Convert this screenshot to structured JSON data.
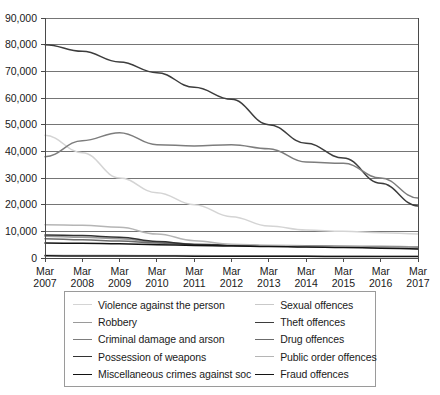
{
  "chart_data": {
    "type": "line",
    "title": "",
    "subtitle": "",
    "xlabel": "",
    "ylabel": "",
    "grid": true,
    "legend_position": "bottom",
    "ylim": [
      0,
      90000
    ],
    "yticks": [
      0,
      10000,
      20000,
      30000,
      40000,
      50000,
      60000,
      70000,
      80000,
      90000
    ],
    "ytick_labels": [
      "0",
      "10,000",
      "20,000",
      "30,000",
      "40,000",
      "50,000",
      "60,000",
      "70,000",
      "80,000",
      "90,000"
    ],
    "categories": [
      "Mar 2007",
      "Mar 2008",
      "Mar 2009",
      "Mar 2010",
      "Mar 2011",
      "Mar 2012",
      "Mar 2013",
      "Mar 2014",
      "Mar 2015",
      "Mar 2016",
      "Mar 2017"
    ],
    "xtick_labels_line1": [
      "Mar",
      "Mar",
      "Mar",
      "Mar",
      "Mar",
      "Mar",
      "Mar",
      "Mar",
      "Mar",
      "Mar",
      "Mar"
    ],
    "xtick_labels_line2": [
      "2007",
      "2008",
      "2009",
      "2010",
      "2011",
      "2012",
      "2013",
      "2014",
      "2015",
      "2016",
      "2017"
    ],
    "series": [
      {
        "name": "Violence against the person",
        "color": "#d4d4d4",
        "values": [
          46000,
          39500,
          30000,
          24500,
          20000,
          15500,
          12000,
          10500,
          10000,
          9500,
          9000
        ]
      },
      {
        "name": "Sexual offences",
        "color": "#c9c9c9",
        "values": [
          1100,
          1050,
          1000,
          950,
          900,
          850,
          800,
          800,
          750,
          700,
          650
        ]
      },
      {
        "name": "Robbery",
        "color": "#9a9a9a",
        "values": [
          8200,
          7800,
          7200,
          6000,
          5200,
          4900,
          4700,
          4600,
          4500,
          4400,
          4200
        ]
      },
      {
        "name": "Theft offences",
        "color": "#3d3d3d",
        "values": [
          80000,
          77500,
          73500,
          69500,
          64000,
          59500,
          50000,
          43000,
          37500,
          28000,
          19500
        ]
      },
      {
        "name": "Criminal damage and arson",
        "color": "#7d7d7d",
        "values": [
          38000,
          44000,
          47000,
          42500,
          42000,
          42500,
          41000,
          36000,
          35500,
          30000,
          22500
        ]
      },
      {
        "name": "Drug offences",
        "color": "#6b6b6b",
        "values": [
          7200,
          6800,
          6400,
          5600,
          5000,
          4800,
          4600,
          4400,
          4200,
          4000,
          3800
        ]
      },
      {
        "name": "Possession of weapons",
        "color": "#333333",
        "values": [
          8600,
          8400,
          7800,
          6200,
          5100,
          4800,
          4500,
          4300,
          4100,
          3900,
          3600
        ]
      },
      {
        "name": "Public order offences",
        "color": "#b5b5b5",
        "values": [
          12500,
          12300,
          11500,
          9000,
          6500,
          5200,
          4700,
          4400,
          4200,
          4000,
          3700
        ]
      },
      {
        "name": "Miscellaneous crimes against soc",
        "color": "#121212",
        "values": [
          5600,
          5500,
          5300,
          5000,
          4700,
          4500,
          4300,
          4100,
          3900,
          3700,
          3400
        ]
      },
      {
        "name": "Fraud offences",
        "color": "#141414",
        "values": [
          800,
          780,
          760,
          740,
          700,
          680,
          650,
          620,
          600,
          560,
          520
        ]
      }
    ]
  },
  "legend": {
    "items": [
      {
        "label": "Violence against the person",
        "color": "#d4d4d4"
      },
      {
        "label": "Sexual offences",
        "color": "#c9c9c9"
      },
      {
        "label": "Robbery",
        "color": "#9a9a9a"
      },
      {
        "label": "Theft offences",
        "color": "#3d3d3d"
      },
      {
        "label": "Criminal damage and arson",
        "color": "#7d7d7d"
      },
      {
        "label": "Drug offences",
        "color": "#6b6b6b"
      },
      {
        "label": "Possession of weapons",
        "color": "#333333"
      },
      {
        "label": "Public order offences",
        "color": "#b5b5b5"
      },
      {
        "label": "Miscellaneous crimes against soc",
        "color": "#121212"
      },
      {
        "label": "Fraud offences",
        "color": "#141414"
      }
    ]
  }
}
